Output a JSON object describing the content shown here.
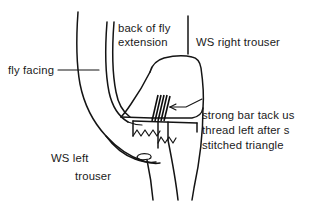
{
  "figure": {
    "background_color": "#ffffff",
    "ink_color": "#141414",
    "width": 311,
    "height": 206
  },
  "labels": {
    "back_of_fly_extension": {
      "line1": "back of fly",
      "line2": "extension"
    },
    "ws_right_trouser": "WS right trouser",
    "fly_facing": "fly facing",
    "ws_left_trouser": {
      "line1": "WS left",
      "line2": "trouser"
    },
    "bar_tack_note": {
      "line1": "strong bar tack us",
      "line2": "thread left after s",
      "line3": "stitched triangle"
    }
  },
  "annotations": {
    "fly_facing_leader": "horizontal-leader-line",
    "bar_tack_arrow": "arrow-pointing-left-to-bar-tack"
  }
}
